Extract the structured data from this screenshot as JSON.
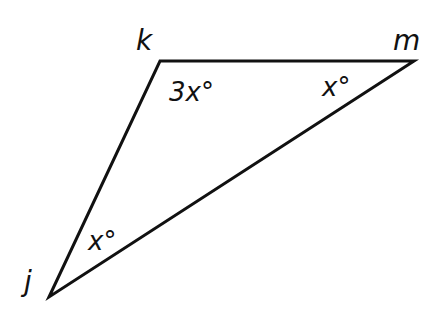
{
  "diagram": {
    "type": "triangle",
    "stroke_color": "#111111",
    "background": "#ffffff",
    "vertices": {
      "k": {
        "label": "k",
        "x": 160,
        "y": 61
      },
      "m": {
        "label": "m",
        "x": 414,
        "y": 61
      },
      "j": {
        "label": "j",
        "x": 49,
        "y": 297
      }
    },
    "angles": {
      "k": "3x°",
      "m": "x°",
      "j": "x°"
    }
  }
}
